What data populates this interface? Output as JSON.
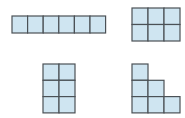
{
  "diagram": {
    "title": "",
    "colors": {
      "cell_fill": "#cfe5f1",
      "cell_stroke": "#4b5156",
      "background": "#ffffff"
    },
    "shapes": [
      {
        "id": "row-1x6",
        "description": "Six unit squares in a single row",
        "rows": 1,
        "cols": 6,
        "cells": [
          [
            0,
            0
          ],
          [
            0,
            1
          ],
          [
            0,
            2
          ],
          [
            0,
            3
          ],
          [
            0,
            4
          ],
          [
            0,
            5
          ]
        ]
      },
      {
        "id": "grid-2x3",
        "description": "Six unit squares in a 2 by 3 rectangle",
        "rows": 2,
        "cols": 3,
        "cells": [
          [
            0,
            0
          ],
          [
            0,
            1
          ],
          [
            0,
            2
          ],
          [
            1,
            0
          ],
          [
            1,
            1
          ],
          [
            1,
            2
          ]
        ]
      },
      {
        "id": "grid-3x2",
        "description": "Six unit squares in a 3 by 2 rectangle",
        "rows": 3,
        "cols": 2,
        "cells": [
          [
            0,
            0
          ],
          [
            0,
            1
          ],
          [
            1,
            0
          ],
          [
            1,
            1
          ],
          [
            2,
            0
          ],
          [
            2,
            1
          ]
        ]
      },
      {
        "id": "staircase",
        "description": "Six unit squares in a staircase (3, 2, 1)",
        "rows": 3,
        "cols": 3,
        "cells": [
          [
            0,
            0
          ],
          [
            1,
            0
          ],
          [
            1,
            1
          ],
          [
            2,
            0
          ],
          [
            2,
            1
          ],
          [
            2,
            2
          ]
        ]
      }
    ]
  }
}
